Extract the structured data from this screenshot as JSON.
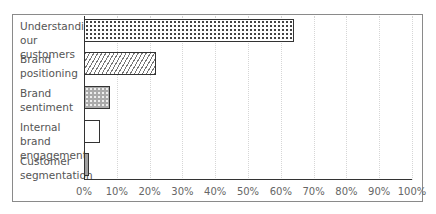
{
  "chart_data": {
    "type": "bar",
    "orientation": "horizontal",
    "title": "",
    "xlabel": "",
    "ylabel": "",
    "categories": [
      "Understanding our customers",
      "Brand positioning",
      "Brand sentiment",
      "Internal brand engagement",
      "Customer segmentation"
    ],
    "category_lines": [
      [
        "Understanding",
        "our customers"
      ],
      [
        "Brand",
        "positioning"
      ],
      [
        "Brand",
        "sentiment"
      ],
      [
        "Internal brand",
        "engagement"
      ],
      [
        "Customer",
        "segmentation"
      ]
    ],
    "values": [
      64,
      22,
      8,
      5,
      1.5
    ],
    "unit": "%",
    "xlim": [
      0,
      100
    ],
    "x_ticks": [
      "0%",
      "10%",
      "20%",
      "30%",
      "40%",
      "50%",
      "60%",
      "70%",
      "80%",
      "90%",
      "100%"
    ],
    "grid": "vertical dotted",
    "legend": "none",
    "bar_patterns": [
      "dots",
      "diagonal-hatch",
      "dark-checker",
      "white",
      "gray-fine"
    ]
  }
}
